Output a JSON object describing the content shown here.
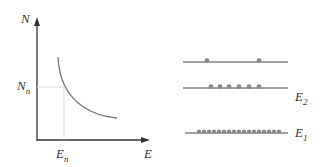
{
  "graph": {
    "y_axis_label": "N",
    "x_axis_label": "E",
    "y_marker_label": "N",
    "y_marker_sub": "n",
    "x_marker_label": "E",
    "x_marker_sub": "n"
  },
  "levels": {
    "upper_label": "",
    "middle_label": "E",
    "middle_sub": "2",
    "lower_label": "E",
    "lower_sub": "1",
    "dot_counts": [
      2,
      6,
      18
    ]
  },
  "colors": {
    "axis": "#333333",
    "curve": "#777777",
    "guide": "#dddddd",
    "dot": "#888888"
  }
}
